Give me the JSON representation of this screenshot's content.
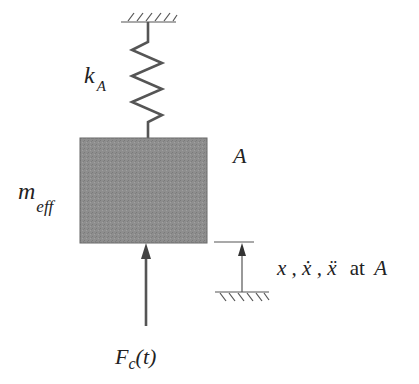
{
  "diagram": {
    "spring_label": {
      "base": "k",
      "sub": "A"
    },
    "mass_label": {
      "base": "m",
      "sub": "eff"
    },
    "point_label": "A",
    "force_label": {
      "base": "F",
      "sub": "c",
      "arg": "(t)"
    },
    "motion_label": {
      "vars": "x , ẋ , ẍ",
      "suffix": "at",
      "point": "A"
    },
    "colors": {
      "mass_fill": "#8c8c8c",
      "line": "#555555",
      "text": "#222222"
    }
  }
}
